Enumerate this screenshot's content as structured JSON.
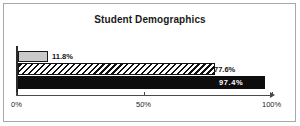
{
  "chart_data": {
    "type": "bar",
    "orientation": "horizontal",
    "title": "Student Demographics",
    "xlabel": "",
    "ylabel": "",
    "xlim": [
      0,
      100
    ],
    "grid": false,
    "legend": "none",
    "tick_labels": [
      "0%",
      "50%",
      "100%"
    ],
    "ticks": [
      0,
      50,
      100
    ],
    "categories": [
      "Series 1",
      "Series 2",
      "Series 3"
    ],
    "values": [
      11.8,
      77.6,
      97.4
    ],
    "data_labels": [
      "11.8%",
      "77.6%",
      "97.4%"
    ],
    "series": [
      {
        "name": "Series 1",
        "value": 11.8,
        "label": "11.8%",
        "fill": "#c9c9c9",
        "style": "solid-gray",
        "label_position": "outside"
      },
      {
        "name": "Series 2",
        "value": 77.6,
        "label": "77.6%",
        "fill": "#ffffff",
        "style": "diagonal-hatch",
        "label_position": "outside"
      },
      {
        "name": "Series 3",
        "value": 97.4,
        "label": "97.4%",
        "fill": "#0d0d0d",
        "style": "solid-black",
        "label_position": "inside"
      }
    ]
  },
  "axis": {
    "tick_0": "0%",
    "tick_50": "50%",
    "tick_100": "100%"
  }
}
